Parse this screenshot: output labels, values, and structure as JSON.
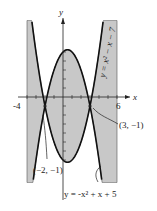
{
  "chart_data": {
    "type": "area",
    "title": "",
    "xlabel": "x",
    "ylabel": "y",
    "xlim": [
      -4,
      6
    ],
    "ylim": [
      -9.5,
      8.5
    ],
    "x_ticks": [
      "-4",
      "6"
    ],
    "series": [
      {
        "name": "y = -x^2 + x + 5",
        "equation": "y = -x² + x + 5",
        "vertex": [
          0.5,
          5.25
        ]
      },
      {
        "name": "y = x^2 - x - 7",
        "equation": "y = x² - x - 7",
        "vertex": [
          0.5,
          -7.25
        ]
      }
    ],
    "shaded_region": "between the two parabolas for -4 ≤ x ≤ 6",
    "annotations": [
      {
        "label": "(-2, -1)",
        "x": -2,
        "y": -1
      },
      {
        "label": "(3, -1)",
        "x": 3,
        "y": -1
      }
    ],
    "grid": false
  },
  "labels": {
    "y_axis": "y",
    "x_axis": "x",
    "tick_neg4": "-4",
    "tick_6": "6",
    "curve_top": "y = -x² + x + 5",
    "curve_right": "y = x² − x − 7",
    "point_left": "(−2, −1)",
    "point_right": "(3, −1)"
  }
}
